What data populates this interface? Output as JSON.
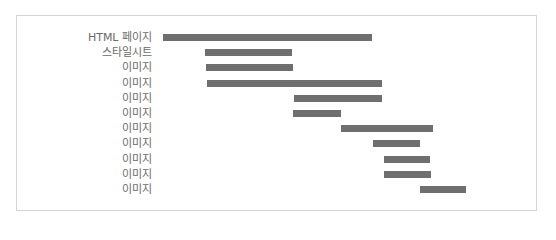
{
  "chart_data": {
    "type": "bar",
    "subtype": "waterfall-timeline",
    "title": "",
    "xlabel": "",
    "ylabel": "",
    "grid": false,
    "legend": null,
    "categories": [
      "HTML 페이지",
      "스타일시트",
      "이미지",
      "이미지",
      "이미지",
      "이미지",
      "이미지",
      "이미지",
      "이미지",
      "이미지",
      "이미지"
    ],
    "series": [
      {
        "name": "request timeline",
        "color": "#6f6f6f",
        "start": [
          0,
          42,
          43,
          44,
          131,
          130,
          178,
          210,
          221,
          221,
          257
        ],
        "end": [
          209,
          129,
          130,
          219,
          219,
          178,
          270,
          257,
          267,
          268,
          303
        ]
      }
    ],
    "x_units": "relative pixels from first request start",
    "xlim": [
      0,
      310
    ]
  },
  "rows": [
    {
      "label": "HTML 페이지",
      "x0": 163,
      "x1": 372
    },
    {
      "label": "스타일시트",
      "x0": 205,
      "x1": 292
    },
    {
      "label": "이미지",
      "x0": 206,
      "x1": 293
    },
    {
      "label": "이미지",
      "x0": 207,
      "x1": 382
    },
    {
      "label": "이미지",
      "x0": 294,
      "x1": 382
    },
    {
      "label": "이미지",
      "x0": 293,
      "x1": 341
    },
    {
      "label": "이미지",
      "x0": 341,
      "x1": 433
    },
    {
      "label": "이미지",
      "x0": 373,
      "x1": 420
    },
    {
      "label": "이미지",
      "x0": 384,
      "x1": 430
    },
    {
      "label": "이미지",
      "x0": 384,
      "x1": 431
    },
    {
      "label": "이미지",
      "x0": 420,
      "x1": 466
    }
  ],
  "layout": {
    "row_top": 30,
    "row_step": 15.2
  }
}
